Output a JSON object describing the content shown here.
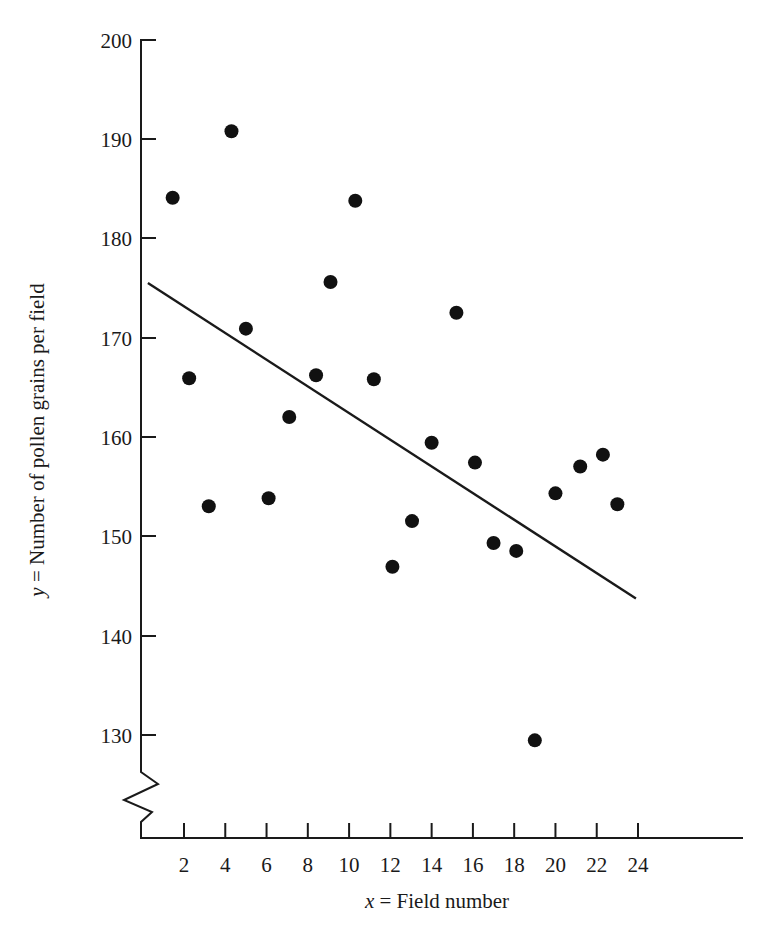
{
  "chart_data": {
    "type": "scatter",
    "title": "",
    "xlabel": "x = Field number",
    "ylabel": "y = Number of pollen grains per field",
    "xlabel_var": "x",
    "xlabel_rest": " =  Field number",
    "ylabel_var": "y",
    "ylabel_rest": " =  Number of pollen grains per field",
    "xlim": [
      0,
      24.4
    ],
    "ylim": [
      126,
      200
    ],
    "y_axis_broken": true,
    "y_break_note": "axis break (zigzag) below 130",
    "grid": false,
    "legend": false,
    "xticks": [
      2,
      4,
      6,
      8,
      10,
      12,
      14,
      16,
      18,
      20,
      22,
      24
    ],
    "xtick_labels": [
      "2",
      "4",
      "6",
      "8",
      "10",
      "12",
      "14",
      "16",
      "18",
      "20",
      "22",
      "24"
    ],
    "yticks": [
      130,
      140,
      150,
      160,
      170,
      180,
      190,
      200
    ],
    "ytick_labels": [
      "130",
      "140",
      "150",
      "160",
      "170",
      "180",
      "190",
      "200"
    ],
    "x": [
      1.45,
      2.25,
      3.2,
      4.3,
      5.0,
      6.1,
      7.1,
      8.4,
      9.1,
      10.3,
      11.2,
      12.1,
      13.05,
      14.0,
      15.2,
      16.1,
      17.0,
      18.1,
      19.0,
      20.0,
      21.2,
      22.3,
      23.0
    ],
    "y": [
      184.1,
      165.9,
      153.0,
      190.8,
      170.9,
      153.8,
      162.0,
      166.2,
      175.6,
      183.8,
      165.8,
      146.9,
      151.5,
      159.4,
      172.5,
      157.4,
      149.3,
      148.5,
      129.4,
      154.3,
      157.0,
      158.2,
      153.2
    ],
    "points": [
      {
        "x": 1.45,
        "y": 184.1
      },
      {
        "x": 2.25,
        "y": 165.9
      },
      {
        "x": 3.2,
        "y": 153.0
      },
      {
        "x": 4.3,
        "y": 190.8
      },
      {
        "x": 5.0,
        "y": 170.9
      },
      {
        "x": 6.1,
        "y": 153.8
      },
      {
        "x": 7.1,
        "y": 162.0
      },
      {
        "x": 8.4,
        "y": 166.2
      },
      {
        "x": 9.1,
        "y": 175.6
      },
      {
        "x": 10.3,
        "y": 183.8
      },
      {
        "x": 11.2,
        "y": 165.8
      },
      {
        "x": 12.1,
        "y": 146.9
      },
      {
        "x": 13.05,
        "y": 151.5
      },
      {
        "x": 14.0,
        "y": 159.4
      },
      {
        "x": 15.2,
        "y": 172.5
      },
      {
        "x": 16.1,
        "y": 157.4
      },
      {
        "x": 17.0,
        "y": 149.3
      },
      {
        "x": 18.1,
        "y": 148.5
      },
      {
        "x": 19.0,
        "y": 129.4
      },
      {
        "x": 20.0,
        "y": 154.3
      },
      {
        "x": 21.2,
        "y": 157.0
      },
      {
        "x": 22.3,
        "y": 158.2
      },
      {
        "x": 23.0,
        "y": 153.2
      }
    ],
    "trend_line": {
      "type": "linear-fit",
      "x_start": 0.25,
      "y_start": 175.5,
      "x_end": 23.9,
      "y_end": 143.7,
      "slope": -1.345,
      "intercept": 175.84
    },
    "marker": {
      "shape": "circle",
      "radius_px": 7,
      "color": "#111111"
    },
    "colors": {
      "axis": "#1a1a1a",
      "point": "#111111",
      "line": "#1a1a1a",
      "background": "#ffffff"
    }
  }
}
